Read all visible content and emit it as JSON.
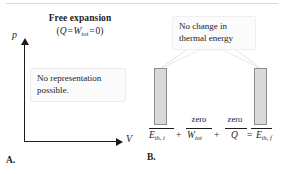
{
  "figure": {
    "title": "Free expansion",
    "panels": [
      "A.",
      "B."
    ]
  },
  "panel_a": {
    "label": "A.",
    "title": "Free expansion",
    "equation": {
      "quantity_1": "Q",
      "operator_1": "=",
      "quantity_2": "W",
      "quantity_2_subscript": "tot",
      "operator_2": "=",
      "value": "0",
      "open_paren": "(",
      "close_paren": ")",
      "plain": "(Q = W_tot = 0)"
    },
    "axes": {
      "y_label": "p",
      "x_label": "V"
    },
    "callout": {
      "line_1": "No representation",
      "line_2": "possible."
    }
  },
  "panel_b": {
    "label": "B.",
    "callout": {
      "line_1": "No change in",
      "line_2": "thermal energy"
    },
    "equation": {
      "term_initial": "E",
      "term_initial_subscript": "th, i",
      "operator_1": "+",
      "term_work": "W",
      "term_work_subscript": "tot",
      "operator_2": "+",
      "term_heat": "Q",
      "operator_3": "=",
      "term_final": "E",
      "term_final_subscript": "th, f",
      "plain": "E_th,i + W_tot + Q = E_th,f"
    },
    "annotations": {
      "zero_work": "zero",
      "zero_heat": "zero"
    }
  },
  "chart_data": {
    "type": "bar",
    "categories": [
      "E_th,i",
      "W_tot",
      "Q",
      "E_th,f"
    ],
    "values": [
      57,
      0,
      0,
      57
    ],
    "value_labels": [
      "",
      "zero",
      "zero",
      ""
    ],
    "xlabel": "",
    "ylabel": "Energy",
    "ylim": [
      0,
      70
    ],
    "grid": false,
    "legend": "none"
  },
  "colors": {
    "bar_fill": "#d9d9d9",
    "bar_stroke": "#8c8c8c",
    "ink": "#1b1b1b",
    "callout_fill": "#fbfbfb",
    "callout_stroke": "#ececec",
    "leader_line": "#e2e2e2"
  }
}
